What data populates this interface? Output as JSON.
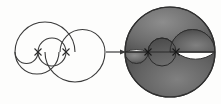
{
  "figure": {
    "background_color": "#fdfdfc",
    "stroke_color": "#3a3a3a",
    "fill_color": "#6b6b6b",
    "fill_color_dark": "#4a4a4a",
    "fill_color_light": "#8a8a8a",
    "stroke_width": 1.1,
    "panels": [
      {
        "id": "left-panel",
        "name": "outline-construction",
        "label": "",
        "shaded": false,
        "circle": {
          "cx": 60,
          "cy": 52,
          "r": 45
        },
        "diameter_line": {
          "x1": 15,
          "y1": 52,
          "x2": 105,
          "y2": 52
        },
        "marks": [
          {
            "name": "division-mark-1",
            "x": 38,
            "y": 52,
            "glyph": "x"
          },
          {
            "name": "division-mark-2",
            "x": 66,
            "y": 52,
            "glyph": "x"
          }
        ],
        "arcs": [
          {
            "name": "large-upper-arc",
            "cx": 45,
            "cy": 52,
            "r": 30,
            "sweep": "upper"
          },
          {
            "name": "large-lower-arc",
            "cx": 75,
            "cy": 52,
            "r": 30,
            "sweep": "lower"
          },
          {
            "name": "small-upper-arc",
            "cx": 82,
            "cy": 52,
            "r": 22,
            "sweep": "upper"
          },
          {
            "name": "small-lower-arc",
            "cx": 30,
            "cy": 52,
            "r": 15,
            "sweep": "lower"
          },
          {
            "name": "inner-upper-arc",
            "cx": 52,
            "cy": 52,
            "r": 14,
            "sweep": "upper"
          },
          {
            "name": "inner-lower-arc",
            "cx": 52,
            "cy": 52,
            "r": 14,
            "sweep": "lower"
          }
        ]
      },
      {
        "id": "right-panel",
        "name": "shaded-construction",
        "label": "",
        "shaded": true,
        "circle": {
          "cx": 170,
          "cy": 52,
          "r": 45
        },
        "diameter_line": {
          "x1": 125,
          "y1": 52,
          "x2": 215,
          "y2": 52
        },
        "marks": [
          {
            "name": "division-mark-1",
            "x": 148,
            "y": 52,
            "glyph": "x"
          },
          {
            "name": "division-mark-2",
            "x": 176,
            "y": 52,
            "glyph": "x"
          }
        ],
        "arcs": [
          {
            "name": "large-upper-arc",
            "cx": 155,
            "cy": 52,
            "r": 30,
            "sweep": "upper"
          },
          {
            "name": "large-lower-arc",
            "cx": 185,
            "cy": 52,
            "r": 30,
            "sweep": "lower"
          },
          {
            "name": "small-upper-arc",
            "cx": 192,
            "cy": 52,
            "r": 22,
            "sweep": "upper"
          },
          {
            "name": "small-lower-arc",
            "cx": 140,
            "cy": 52,
            "r": 15,
            "sweep": "lower"
          },
          {
            "name": "inner-upper-arc",
            "cx": 162,
            "cy": 52,
            "r": 14,
            "sweep": "upper"
          },
          {
            "name": "inner-lower-arc",
            "cx": 162,
            "cy": 52,
            "r": 14,
            "sweep": "lower"
          }
        ]
      }
    ],
    "arrow": {
      "name": "transform-arrow",
      "x1": 106,
      "y1": 52,
      "x2": 126,
      "y2": 52,
      "head_size": 4,
      "color": "#3a3a3a",
      "label": ""
    }
  }
}
